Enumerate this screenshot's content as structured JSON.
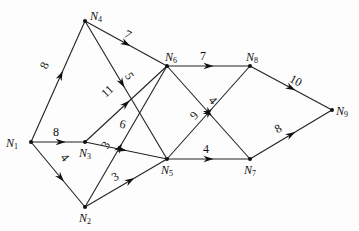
{
  "diagram": {
    "type": "directed-weighted-network",
    "nodes": [
      {
        "id": "N1",
        "label": "N",
        "sub": "1",
        "x": 31,
        "y": 142,
        "lx": 6,
        "ly": 147
      },
      {
        "id": "N2",
        "label": "N",
        "sub": "2",
        "x": 85,
        "y": 207,
        "lx": 79,
        "ly": 222
      },
      {
        "id": "N3",
        "label": "N",
        "sub": "3",
        "x": 85,
        "y": 142,
        "lx": 79,
        "ly": 157
      },
      {
        "id": "N4",
        "label": "N",
        "sub": "4",
        "x": 85,
        "y": 21,
        "lx": 90,
        "ly": 20
      },
      {
        "id": "N5",
        "label": "N",
        "sub": "5",
        "x": 167,
        "y": 159,
        "lx": 161,
        "ly": 174
      },
      {
        "id": "N6",
        "label": "N",
        "sub": "6",
        "x": 167,
        "y": 66,
        "lx": 165,
        "ly": 61
      },
      {
        "id": "N7",
        "label": "N",
        "sub": "7",
        "x": 250,
        "y": 159,
        "lx": 244,
        "ly": 174
      },
      {
        "id": "N8",
        "label": "N",
        "sub": "8",
        "x": 250,
        "y": 66,
        "lx": 246,
        "ly": 61
      },
      {
        "id": "N9",
        "label": "N",
        "sub": "9",
        "x": 332,
        "y": 110,
        "lx": 336,
        "ly": 115
      }
    ],
    "edges": [
      {
        "from": "N1",
        "to": "N4",
        "weight": "8",
        "t": 0.55,
        "wx": 48,
        "wy": 67
      },
      {
        "from": "N1",
        "to": "N3",
        "weight": "8",
        "t": 0.55,
        "wx": 56,
        "wy": 136
      },
      {
        "from": "N1",
        "to": "N2",
        "weight": "4",
        "t": 0.55,
        "wx": 62,
        "wy": 160
      },
      {
        "from": "N4",
        "to": "N6",
        "weight": "7",
        "t": 0.5,
        "wx": 126,
        "wy": 38
      },
      {
        "from": "N4",
        "to": "N5",
        "weight": "5",
        "t": 0.45,
        "wx": 126,
        "wy": 78
      },
      {
        "from": "N3",
        "to": "N6",
        "weight": "11",
        "t": 0.5,
        "wx": 110,
        "wy": 94
      },
      {
        "from": "N3",
        "to": "N5",
        "weight": "6",
        "t": 0.45,
        "wx": 122,
        "wy": 128
      },
      {
        "from": "N2",
        "to": "N6",
        "weight": "3",
        "t": 0.42,
        "wx": 109,
        "wy": 147
      },
      {
        "from": "N2",
        "to": "N5",
        "weight": "3",
        "t": 0.55,
        "wx": 117,
        "wy": 180
      },
      {
        "from": "N6",
        "to": "N8",
        "weight": "7",
        "t": 0.5,
        "wx": 203,
        "wy": 60
      },
      {
        "from": "N6",
        "to": "N7",
        "weight": "4",
        "t": 0.5,
        "wx": 210,
        "wy": 103
      },
      {
        "from": "N5",
        "to": "N8",
        "weight": "9",
        "t": 0.5,
        "wx": 197,
        "wy": 118
      },
      {
        "from": "N5",
        "to": "N7",
        "weight": "4",
        "t": 0.5,
        "wx": 206,
        "wy": 153
      },
      {
        "from": "N8",
        "to": "N9",
        "weight": "10",
        "t": 0.5,
        "wx": 294,
        "wy": 84
      },
      {
        "from": "N7",
        "to": "N9",
        "weight": "8",
        "t": 0.5,
        "wx": 280,
        "wy": 132
      }
    ]
  }
}
